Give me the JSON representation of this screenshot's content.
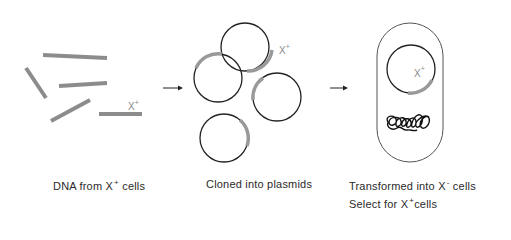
{
  "diagram": {
    "type": "process-flow",
    "topic": "Cloning a gene X+ into plasmids and transforming X- cells",
    "colors": {
      "dna_fragment": "#8c8c8c",
      "plasmid_outline": "#222222",
      "insert_highlight": "#9a9a9a",
      "cell_outline": "#555555",
      "arrow": "#222222",
      "text": "#2a2a2a"
    },
    "steps": [
      {
        "id": "dna",
        "caption_main": "DNA from X",
        "caption_sup": "+",
        "caption_tail": " cells",
        "marker": {
          "text": "X",
          "sup": "+"
        }
      },
      {
        "id": "plasmids",
        "caption_main": "Cloned into plasmids",
        "plasmid_count": 4,
        "marker": {
          "text": "X",
          "sup": "+"
        }
      },
      {
        "id": "transform",
        "caption_main": "Transformed into X",
        "caption_sup": "-",
        "caption_tail": " cells",
        "caption2_main": "Select for X",
        "caption2_sup": "+",
        "caption2_tail": "cells",
        "marker": {
          "text": "X",
          "sup": "+"
        }
      }
    ],
    "arrows": [
      {
        "from": "dna",
        "to": "plasmids"
      },
      {
        "from": "plasmids",
        "to": "transform"
      }
    ]
  }
}
